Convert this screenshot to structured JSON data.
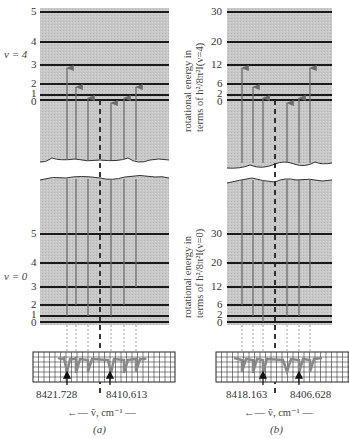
{
  "panels": [
    {
      "id": "a",
      "caption": "(a)",
      "upper_state_label": "v = 4",
      "lower_state_label": "v = 0",
      "upper_levels": [
        "5",
        "4",
        "3",
        "2",
        "1",
        "0"
      ],
      "lower_levels": [
        "5",
        "4",
        "3",
        "2",
        "1",
        "0"
      ],
      "freq_labels": [
        "8421.728",
        "8410.613"
      ],
      "axis_label": "←— ṽ, cm⁻¹ —"
    },
    {
      "id": "b",
      "caption": "(b)",
      "upper_axis_title_line1": "rotational energy in",
      "upper_axis_title_line2": "terms of h²/8π²I(v=4)",
      "lower_axis_title_line1": "rotational energy in",
      "lower_axis_title_line2": "terms of h²/8π²I(v=0)",
      "upper_levels": [
        "30",
        "20",
        "12",
        "6",
        "2",
        "0"
      ],
      "lower_levels": [
        "30",
        "20",
        "12",
        "6",
        "2",
        "0"
      ],
      "freq_labels": [
        "8418.163",
        "8406.628"
      ],
      "axis_label": "←— ṽ, cm⁻¹ —"
    }
  ],
  "colors": {
    "panel_fill": "#c4c4c4",
    "level_line": "#1a1a1a",
    "transition": "#6b6b6b",
    "grid": "#222222"
  }
}
